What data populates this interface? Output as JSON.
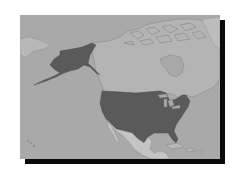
{
  "map": {
    "region": "North America",
    "style": "grayscale",
    "highlighted_country": "United States",
    "colors": {
      "ocean": "#a9a9a9",
      "land": "#b4b4b4",
      "highlight": "#5a5a5a",
      "mexico": "#c4c4c4",
      "border": "#7a7a7a",
      "shadow": "#0a0a0a"
    },
    "features": [
      "Canada",
      "Alaska",
      "United States",
      "Mexico",
      "Greenland",
      "Caribbean"
    ]
  }
}
